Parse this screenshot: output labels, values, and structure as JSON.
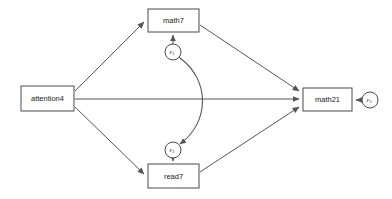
{
  "diagram": {
    "type": "path-analysis-sem",
    "canvas": {
      "width": 392,
      "height": 199,
      "background": "#ffffff"
    },
    "stroke_color": "#555555",
    "box_stroke_color": "#4a4a4a",
    "nodes": [
      {
        "id": "attention4",
        "label": "attention4",
        "shape": "rectangle",
        "x": 21,
        "y": 86,
        "width": 53,
        "height": 25,
        "cx": 47.5,
        "cy": 98.5
      },
      {
        "id": "math7",
        "label": "math7",
        "shape": "rectangle",
        "x": 148,
        "y": 9,
        "width": 51,
        "height": 23,
        "cx": 173.5,
        "cy": 20.5
      },
      {
        "id": "read7",
        "label": "read7",
        "shape": "rectangle",
        "x": 148,
        "y": 164,
        "width": 51,
        "height": 24,
        "cx": 173.5,
        "cy": 176
      },
      {
        "id": "math21",
        "label": "math21",
        "shape": "rectangle",
        "x": 303,
        "y": 88,
        "width": 49,
        "height": 23,
        "cx": 327.5,
        "cy": 99.5
      }
    ],
    "error_terms": [
      {
        "id": "e1",
        "symbol": "ε",
        "subscript": "1",
        "shape": "circle",
        "cx": 173,
        "cy": 52,
        "r": 8,
        "target": "math7"
      },
      {
        "id": "e2",
        "symbol": "ε",
        "subscript": "2",
        "shape": "circle",
        "cx": 173,
        "cy": 150,
        "r": 8,
        "target": "read7"
      },
      {
        "id": "e3",
        "symbol": "ε",
        "subscript": "3",
        "shape": "circle",
        "cx": 370,
        "cy": 100,
        "r": 8,
        "target": "math21"
      }
    ],
    "edges": [
      {
        "id": "attention4-to-math7",
        "from": "attention4",
        "to": "math7",
        "style": "directed"
      },
      {
        "id": "attention4-to-read7",
        "from": "attention4",
        "to": "read7",
        "style": "directed"
      },
      {
        "id": "attention4-to-math21",
        "from": "attention4",
        "to": "math21",
        "style": "directed"
      },
      {
        "id": "math7-to-math21",
        "from": "math7",
        "to": "math21",
        "style": "directed"
      },
      {
        "id": "read7-to-math21",
        "from": "read7",
        "to": "math21",
        "style": "directed"
      },
      {
        "id": "e1-to-math7",
        "from": "e1",
        "to": "math7",
        "style": "directed"
      },
      {
        "id": "e2-to-read7",
        "from": "e2",
        "to": "read7",
        "style": "directed"
      },
      {
        "id": "e3-to-math21",
        "from": "e3",
        "to": "math21",
        "style": "directed"
      },
      {
        "id": "e1-covary-e2",
        "from": "e1",
        "to": "e2",
        "style": "bidirected-curved"
      }
    ]
  }
}
